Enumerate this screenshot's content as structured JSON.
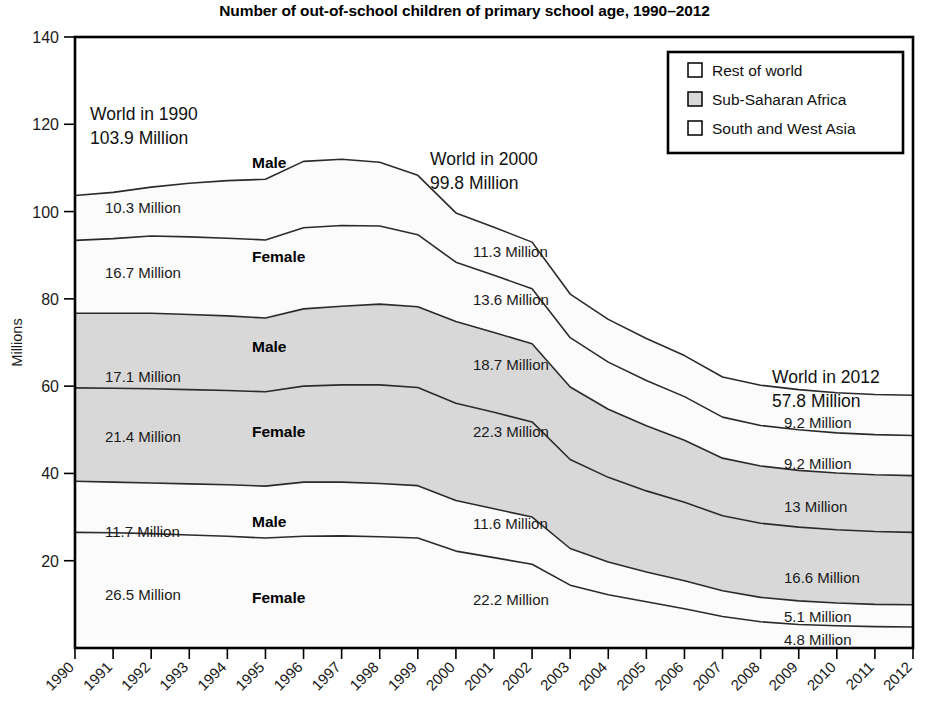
{
  "chart_data": {
    "type": "area",
    "title": "Number of out-of-school children of primary school age, 1990–2012",
    "xlabel": "",
    "ylabel": "Millions",
    "ylim": [
      0,
      140
    ],
    "ytick_labels": [
      "20",
      "40",
      "60",
      "80",
      "100",
      "120",
      "140"
    ],
    "yticks": [
      20,
      40,
      60,
      80,
      100,
      120,
      140
    ],
    "grid": false,
    "legend_position": "top-right",
    "stacked": true,
    "stack_order_bottom_to_top": [
      "South and West Asia – Female",
      "South and West Asia – Male",
      "Sub-Saharan Africa – Female",
      "Sub-Saharan Africa – Male",
      "Rest of world – Female",
      "Rest of world – Male"
    ],
    "categories": [
      "1990",
      "1991",
      "1992",
      "1993",
      "1994",
      "1995",
      "1996",
      "1997",
      "1998",
      "1999",
      "2000",
      "2001",
      "2002",
      "2003",
      "2004",
      "2005",
      "2006",
      "2007",
      "2008",
      "2009",
      "2010",
      "2011",
      "2012"
    ],
    "series": [
      {
        "name": "South and West Asia – Female",
        "region": "South and West Asia",
        "sex": "Female",
        "fill": "#fbfbfb",
        "values": [
          26.5,
          26.4,
          26.2,
          25.9,
          25.6,
          25.2,
          25.6,
          25.7,
          25.5,
          25.2,
          22.2,
          20.7,
          19.2,
          14.4,
          12.2,
          10.6,
          9.0,
          7.2,
          6.0,
          5.4,
          5.1,
          4.9,
          4.8
        ]
      },
      {
        "name": "South and West Asia – Male",
        "region": "South and West Asia",
        "sex": "Male",
        "fill": "#fbfbfb",
        "values": [
          11.7,
          11.6,
          11.6,
          11.7,
          11.8,
          11.9,
          12.4,
          12.3,
          12.2,
          12.0,
          11.6,
          11.2,
          10.8,
          8.4,
          7.5,
          6.8,
          6.4,
          5.9,
          5.6,
          5.4,
          5.2,
          5.1,
          5.1
        ]
      },
      {
        "name": "Sub-Saharan Africa – Female",
        "region": "Sub-Saharan Africa",
        "sex": "Female",
        "fill": "#d8d8d8",
        "values": [
          21.4,
          21.5,
          21.6,
          21.6,
          21.6,
          21.6,
          22.0,
          22.3,
          22.6,
          22.5,
          22.3,
          22.1,
          21.8,
          20.4,
          19.4,
          18.6,
          18.0,
          17.2,
          17.0,
          16.9,
          16.8,
          16.7,
          16.6
        ]
      },
      {
        "name": "Sub-Saharan Africa – Male",
        "region": "Sub-Saharan Africa",
        "sex": "Male",
        "fill": "#d8d8d8",
        "values": [
          17.1,
          17.2,
          17.3,
          17.2,
          17.1,
          16.9,
          17.7,
          18.0,
          18.5,
          18.5,
          18.7,
          18.3,
          17.9,
          16.6,
          15.6,
          14.9,
          14.2,
          13.2,
          13.1,
          13.0,
          13.0,
          13.0,
          13.0
        ]
      },
      {
        "name": "Rest of world – Female",
        "region": "Rest of world",
        "sex": "Female",
        "fill": "#fbfbfb",
        "values": [
          16.7,
          17.1,
          17.7,
          17.8,
          17.8,
          17.9,
          18.6,
          18.5,
          17.9,
          16.5,
          13.6,
          13.1,
          12.6,
          11.3,
          10.8,
          10.4,
          10.0,
          9.4,
          9.3,
          9.3,
          9.2,
          9.2,
          9.2
        ]
      },
      {
        "name": "Rest of world – Male",
        "region": "Rest of world",
        "sex": "Male",
        "fill": "#fbfbfb",
        "values": [
          10.3,
          10.6,
          11.2,
          12.3,
          13.2,
          13.9,
          15.2,
          15.2,
          14.6,
          13.6,
          11.3,
          11.0,
          10.7,
          10.0,
          9.8,
          9.6,
          9.4,
          9.2,
          9.2,
          9.2,
          9.2,
          9.2,
          9.2
        ]
      }
    ],
    "annotations": {
      "world_1990": {
        "title": "World in 1990",
        "value": "103.9 Million"
      },
      "world_2000": {
        "title": "World in 2000",
        "value": "99.8 Million"
      },
      "world_2012": {
        "title": "World in 2012",
        "value": "57.8 Million"
      },
      "left_values": [
        "10.3 Million",
        "16.7 Million",
        "17.1 Million",
        "21.4 Million",
        "11.7 Million",
        "26.5 Million"
      ],
      "middle_values": [
        "11.3 Million",
        "13.6 Million",
        "18.7 Million",
        "22.3 Million",
        "11.6 Million",
        "22.2 Million"
      ],
      "right_values": [
        "9.2 Million",
        "9.2 Million",
        "13 Million",
        "16.6 Million",
        "5.1 Million",
        "4.8 Million"
      ],
      "sex_labels": [
        "Male",
        "Female",
        "Male",
        "Female",
        "Male",
        "Female"
      ]
    },
    "legend": [
      {
        "label": "Rest of world",
        "color": "#ffffff"
      },
      {
        "label": "Sub-Saharan Africa",
        "color": "#d8d8d8"
      },
      {
        "label": "South and West Asia",
        "color": "#ffffff"
      }
    ]
  }
}
